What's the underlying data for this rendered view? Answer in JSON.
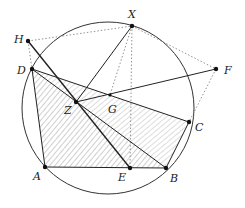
{
  "diagram": {
    "circle": {
      "cx": 108,
      "cy": 108,
      "r": 86,
      "stroke": "#333333"
    },
    "points": [
      {
        "id": "A",
        "x": 45,
        "y": 167,
        "label": "A",
        "lx": 33,
        "ly": 180
      },
      {
        "id": "B",
        "x": 166,
        "y": 168,
        "label": "B",
        "lx": 170,
        "ly": 182
      },
      {
        "id": "C",
        "x": 189,
        "y": 122,
        "label": "C",
        "lx": 195,
        "ly": 131
      },
      {
        "id": "D",
        "x": 32,
        "y": 69,
        "label": "D",
        "lx": 17,
        "ly": 74
      },
      {
        "id": "E",
        "x": 130,
        "y": 168,
        "label": "E",
        "lx": 118,
        "ly": 181
      },
      {
        "id": "F",
        "x": 216,
        "y": 69,
        "label": "F",
        "lx": 224,
        "ly": 74
      },
      {
        "id": "G",
        "x": 110,
        "y": 95,
        "label": "G",
        "lx": 108,
        "ly": 113
      },
      {
        "id": "H",
        "x": 28,
        "y": 41,
        "label": "H",
        "lx": 14,
        "ly": 43
      },
      {
        "id": "X",
        "x": 132,
        "y": 26,
        "label": "X",
        "lx": 128,
        "ly": 18
      },
      {
        "id": "Z",
        "x": 76,
        "y": 102,
        "label": "Z",
        "lx": 64,
        "ly": 114
      }
    ],
    "hatched_regions": [
      {
        "name": "triangle-DAB",
        "points": [
          "D",
          "A",
          "B"
        ],
        "pattern": "hatch-a"
      },
      {
        "name": "triangle-DCB",
        "points": [
          "D",
          "C",
          "B"
        ],
        "pattern": "hatch-b"
      }
    ],
    "solid_segments": [
      [
        "A",
        "B"
      ],
      [
        "A",
        "D"
      ],
      [
        "D",
        "B"
      ],
      [
        "D",
        "C"
      ],
      [
        "C",
        "B"
      ],
      [
        "H",
        "E"
      ],
      [
        "X",
        "Z"
      ],
      [
        "Z",
        "F"
      ]
    ],
    "dotted_segments": [
      [
        "H",
        "D"
      ],
      [
        "H",
        "X"
      ],
      [
        "X",
        "F"
      ],
      [
        "F",
        "C"
      ],
      [
        "X",
        "G"
      ],
      [
        "X",
        "E"
      ]
    ]
  }
}
